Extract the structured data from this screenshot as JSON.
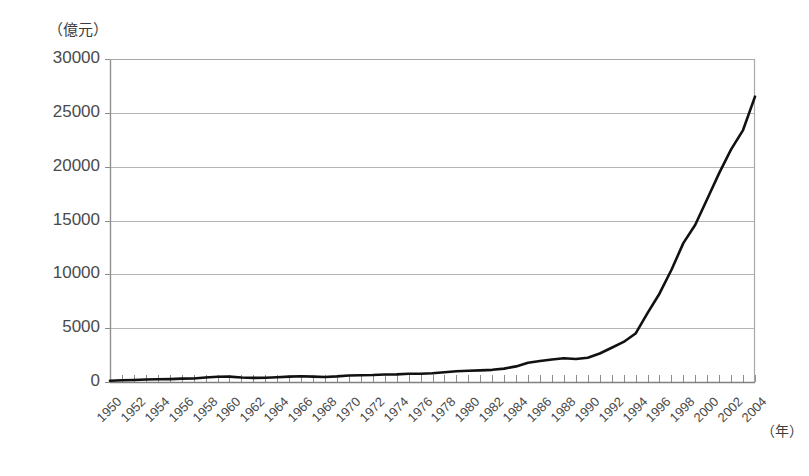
{
  "chart_data": {
    "type": "line",
    "title": "",
    "subtitle": "",
    "ylabel": "（億元）",
    "xlabel": "（年）",
    "ylim": [
      0,
      30000
    ],
    "y_ticks": [
      0,
      5000,
      10000,
      15000,
      20000,
      25000,
      30000
    ],
    "y_tick_labels": [
      "0",
      "5000",
      "10000",
      "15000",
      "20000",
      "25000",
      "30000"
    ],
    "xlim": [
      1950,
      2004
    ],
    "x_tick_labels": [
      "1950",
      "1952",
      "1954",
      "1956",
      "1958",
      "1960",
      "1962",
      "1964",
      "1966",
      "1968",
      "1970",
      "1972",
      "1974",
      "1976",
      "1978",
      "1980",
      "1982",
      "1984",
      "1986",
      "1988",
      "1990",
      "1992",
      "1994",
      "1996",
      "1998",
      "2000",
      "2002",
      "2004"
    ],
    "x_minor_tick_step": 1,
    "grid": "horizontal",
    "legend": "none",
    "line_color": "#111111",
    "axis_color": "#909090",
    "grid_color": "#b4b4b4",
    "x": [
      1950,
      1951,
      1952,
      1953,
      1954,
      1955,
      1956,
      1957,
      1958,
      1959,
      1960,
      1961,
      1962,
      1963,
      1964,
      1965,
      1966,
      1967,
      1968,
      1969,
      1970,
      1971,
      1972,
      1973,
      1974,
      1975,
      1976,
      1977,
      1978,
      1979,
      1980,
      1981,
      1982,
      1983,
      1984,
      1985,
      1986,
      1987,
      1988,
      1989,
      1990,
      1991,
      1992,
      1993,
      1994,
      1995,
      1996,
      1997,
      1998,
      1999,
      2000,
      2001,
      2002,
      2003,
      2004
    ],
    "values": [
      120,
      160,
      190,
      230,
      250,
      270,
      310,
      320,
      420,
      490,
      500,
      420,
      380,
      400,
      440,
      500,
      540,
      500,
      470,
      520,
      600,
      630,
      650,
      700,
      710,
      760,
      760,
      810,
      900,
      1000,
      1040,
      1080,
      1130,
      1240,
      1450,
      1780,
      1950,
      2090,
      2200,
      2130,
      2260,
      2650,
      3180,
      3720,
      4500,
      6400,
      8200,
      10400,
      12900,
      14600,
      17000,
      19400,
      21600,
      23400,
      26500
    ]
  }
}
